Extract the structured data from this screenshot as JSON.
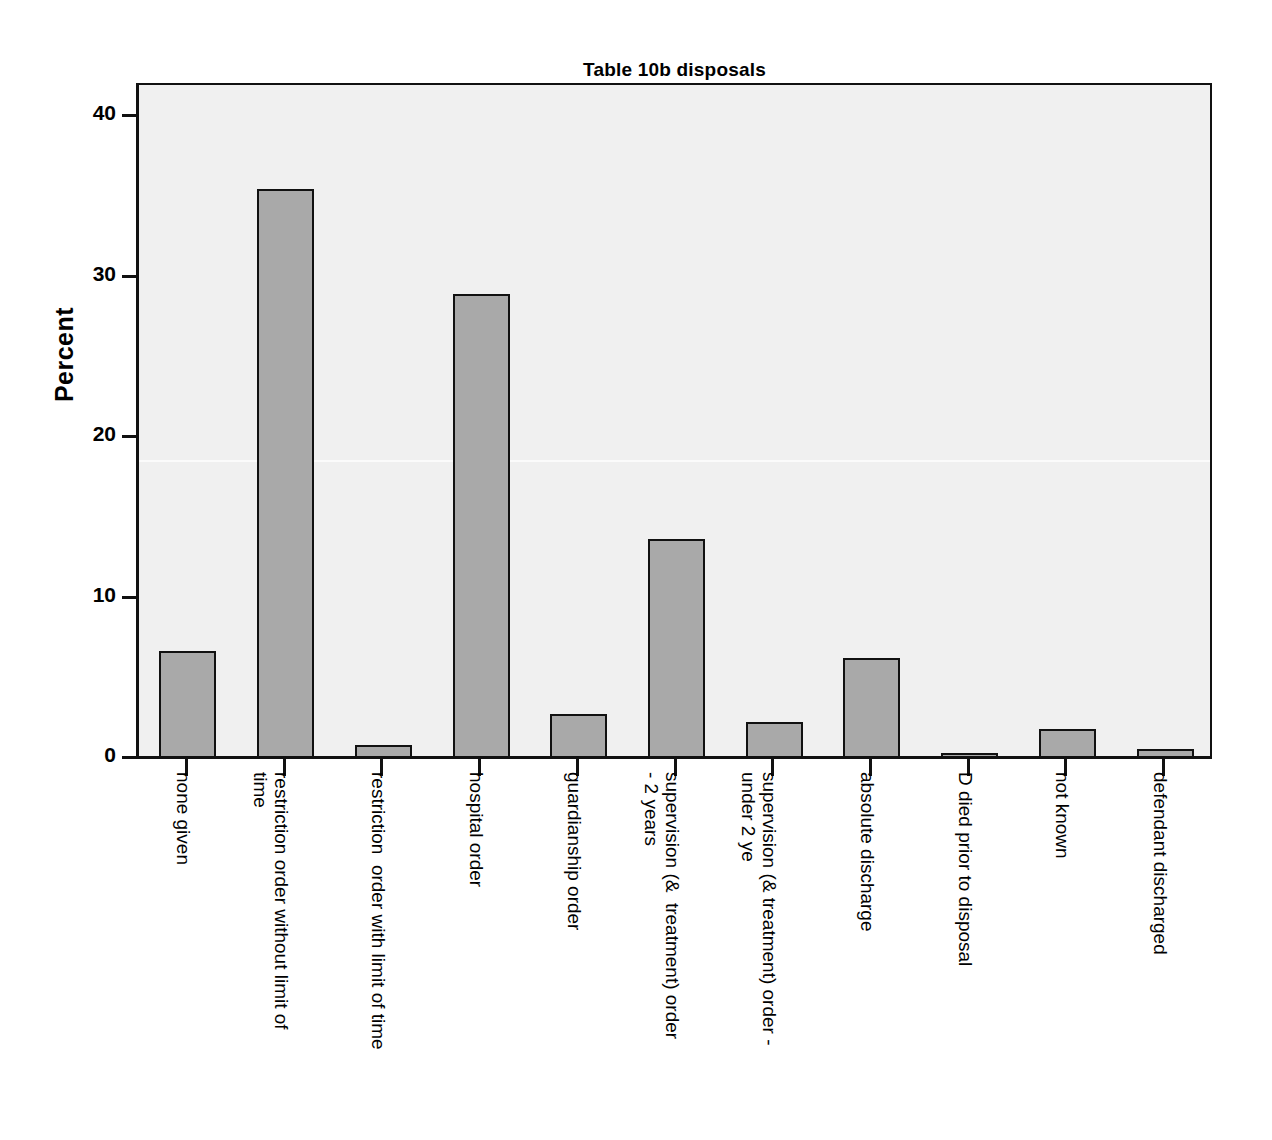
{
  "chart_data": {
    "type": "bar",
    "title": "Table 10b disposals",
    "xlabel": "",
    "ylabel": "Percent",
    "ylim": [
      0,
      42
    ],
    "yticks": [
      0,
      10,
      20,
      30,
      40
    ],
    "ytick_labels": [
      "0",
      "10",
      "20",
      "30",
      "40"
    ],
    "grid": false,
    "legend": null,
    "categories": [
      "none given",
      "restriction order without limit of\ntime",
      "restriction  order with limit of time",
      "hospital order",
      "guardianship order",
      "supervision (&  treatment) order\n- 2 years",
      "supervision (& treatment) order -\nunder 2 ye",
      "absolute discharge",
      "D died prior to disposal",
      "not known",
      "defendant discharged"
    ],
    "values": [
      6.7,
      35.5,
      0.9,
      29.0,
      2.8,
      13.7,
      2.3,
      6.3,
      0.4,
      1.9,
      0.6
    ],
    "bar_fill_color": "#a9a9a9",
    "bar_edge_color": "#111111",
    "plot_background_color": "#f0f0f0",
    "figure_background_color": "#ffffff"
  }
}
